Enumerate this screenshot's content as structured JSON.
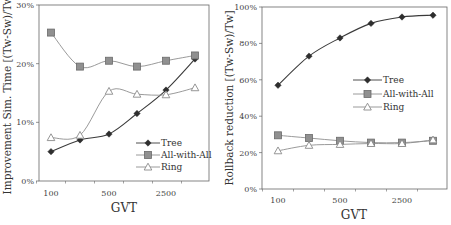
{
  "chart_data": [
    {
      "type": "line",
      "title": "",
      "xlabel": "GVT",
      "ylabel": "Improvement Sim. Time [(Tw-Sw)/Tw]",
      "x": [
        100,
        300,
        500,
        1500,
        2500,
        5000
      ],
      "x_tick_labels": [
        "100",
        "500",
        "2500"
      ],
      "y_tick_labels": [
        "0%",
        "10%",
        "20%",
        "30%"
      ],
      "ylim": [
        0,
        30
      ],
      "grid": false,
      "legend_position": "lower right",
      "series": [
        {
          "name": "Tree",
          "marker": "diamond",
          "color": "#333333",
          "values": [
            5.0,
            7.0,
            8.0,
            11.5,
            15.5,
            20.8
          ]
        },
        {
          "name": "All-with-All",
          "marker": "square",
          "color": "#8a8a8a",
          "values": [
            25.3,
            19.5,
            20.5,
            19.5,
            20.5,
            21.4
          ]
        },
        {
          "name": "Ring",
          "marker": "triangle",
          "color": "#8a8a8a",
          "values": [
            7.4,
            7.8,
            15.3,
            14.8,
            14.7,
            15.9
          ]
        }
      ]
    },
    {
      "type": "line",
      "title": "",
      "xlabel": "GVT",
      "ylabel": "Rollback reduction [(Tw-Sw)/Tw]",
      "x": [
        100,
        300,
        500,
        1500,
        2500,
        5000
      ],
      "x_tick_labels": [
        "100",
        "500",
        "2500"
      ],
      "y_tick_labels": [
        "0%",
        "20%",
        "40%",
        "60%",
        "80%",
        "100%"
      ],
      "ylim": [
        0,
        100
      ],
      "grid": false,
      "legend_position": "center right",
      "series": [
        {
          "name": "Tree",
          "marker": "diamond",
          "color": "#333333",
          "values": [
            57,
            73,
            83,
            91,
            94.5,
            95.5
          ]
        },
        {
          "name": "All-with-All",
          "marker": "square",
          "color": "#8a8a8a",
          "values": [
            29.5,
            28,
            26.5,
            25.5,
            25.5,
            26.5
          ]
        },
        {
          "name": "Ring",
          "marker": "triangle",
          "color": "#8a8a8a",
          "values": [
            21,
            24,
            24.5,
            25,
            25,
            27
          ]
        }
      ]
    }
  ]
}
